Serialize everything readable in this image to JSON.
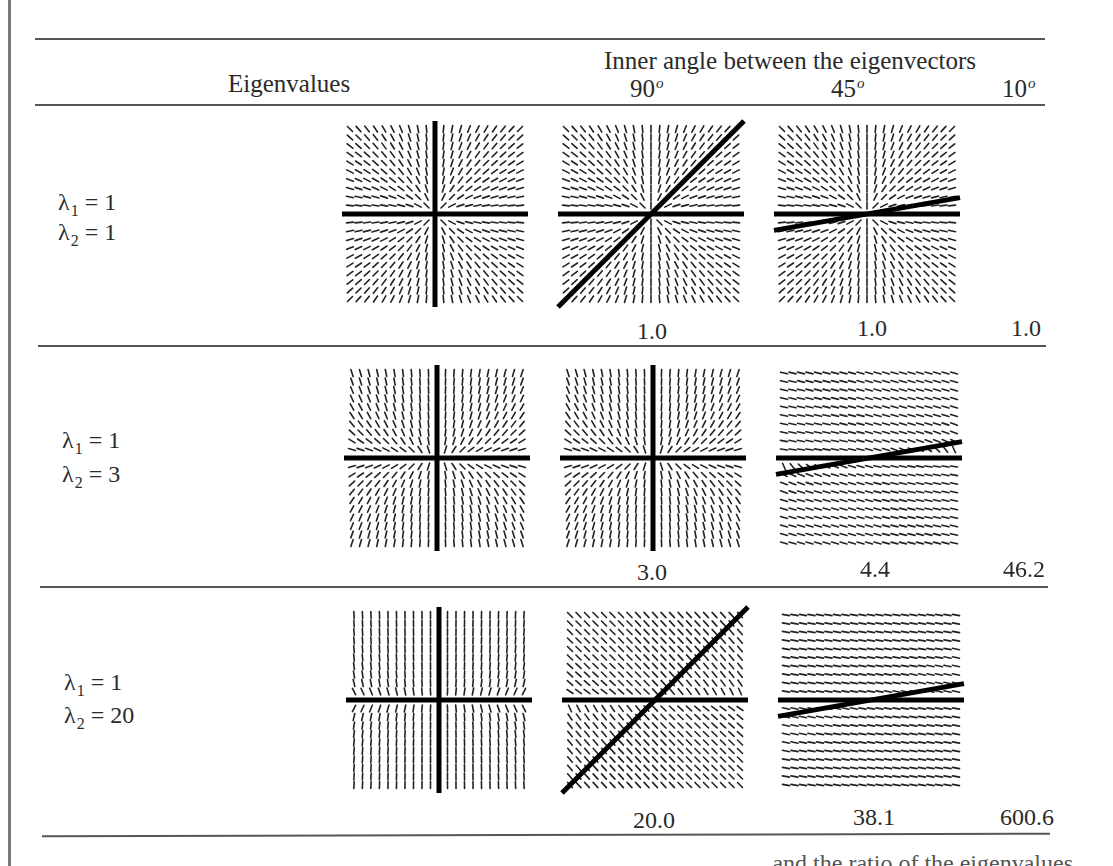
{
  "table": {
    "header": {
      "row_label_heading": "Eigenvalues",
      "column_group_heading": "Inner angle between the eigenvectors",
      "angles": [
        {
          "value": "90",
          "unit": "o"
        },
        {
          "value": "45",
          "unit": "o"
        },
        {
          "value": "10",
          "unit": "o"
        }
      ]
    },
    "rows": [
      {
        "lambda1_label": "λ",
        "lambda1_sub": "1",
        "lambda1_value": "= 1",
        "lambda2_label": "λ",
        "lambda2_sub": "2",
        "lambda2_value": "= 1",
        "values": [
          "1.0",
          "1.0",
          "1.0"
        ]
      },
      {
        "lambda1_label": "λ",
        "lambda1_sub": "1",
        "lambda1_value": "= 1",
        "lambda2_label": "λ",
        "lambda2_sub": "2",
        "lambda2_value": "= 3",
        "values": [
          "3.0",
          "4.4",
          "46.2"
        ]
      },
      {
        "lambda1_label": "λ",
        "lambda1_sub": "1",
        "lambda1_value": "= 1",
        "lambda2_label": "λ",
        "lambda2_sub": "2",
        "lambda2_value": "= 20",
        "values": [
          "20.0",
          "38.1",
          "600.6"
        ]
      }
    ],
    "figures": [
      {
        "row": 0,
        "col": 0,
        "lambda1": 1,
        "lambda2": 1,
        "angle_deg": 90
      },
      {
        "row": 0,
        "col": 1,
        "lambda1": 1,
        "lambda2": 1,
        "angle_deg": 45
      },
      {
        "row": 0,
        "col": 2,
        "lambda1": 1,
        "lambda2": 1,
        "angle_deg": 10
      },
      {
        "row": 1,
        "col": 0,
        "lambda1": 1,
        "lambda2": 3,
        "angle_deg": 90
      },
      {
        "row": 1,
        "col": 1,
        "lambda1": 1,
        "lambda2": 3,
        "angle_deg": 90
      },
      {
        "row": 1,
        "col": 2,
        "lambda1": 1,
        "lambda2": 3,
        "angle_deg": 10
      },
      {
        "row": 2,
        "col": 0,
        "lambda1": 1,
        "lambda2": 20,
        "angle_deg": 90
      },
      {
        "row": 2,
        "col": 1,
        "lambda1": 1,
        "lambda2": 20,
        "angle_deg": 45
      },
      {
        "row": 2,
        "col": 2,
        "lambda1": 1,
        "lambda2": 20,
        "angle_deg": 10
      }
    ]
  },
  "caption_fragment": "and the ratio of the eigenvalues"
}
